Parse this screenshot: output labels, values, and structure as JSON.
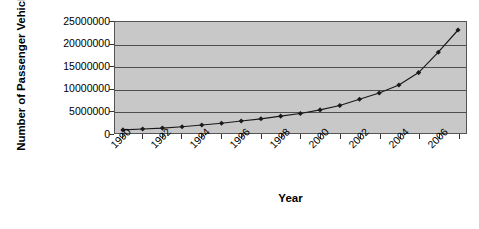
{
  "chart_data": {
    "type": "line",
    "title": "",
    "xlabel": "Year",
    "ylabel": "Number of Passenger Vehicles",
    "x": [
      1990,
      1991,
      1992,
      1993,
      1994,
      1995,
      1996,
      1997,
      1998,
      1999,
      2000,
      2001,
      2002,
      2003,
      2004,
      2005,
      2006,
      2007
    ],
    "values": [
      700000,
      900000,
      1100000,
      1400000,
      1800000,
      2200000,
      2700000,
      3200000,
      3800000,
      4400000,
      5200000,
      6200000,
      7600000,
      9000000,
      10800000,
      13600000,
      18200000,
      23200000
    ],
    "series": [
      {
        "name": "Number of Passenger Vehicles",
        "values": [
          700000,
          900000,
          1100000,
          1400000,
          1800000,
          2200000,
          2700000,
          3200000,
          3800000,
          4400000,
          5200000,
          6200000,
          7600000,
          9000000,
          10800000,
          13600000,
          18200000,
          23200000
        ]
      }
    ],
    "ylim": [
      0,
      25000000
    ],
    "ytick_labels": [
      "25000000",
      "20000000",
      "15000000",
      "10000000",
      "5000000",
      "0"
    ],
    "ytick_values": [
      25000000,
      20000000,
      15000000,
      10000000,
      5000000,
      0
    ],
    "xtick_labels": [
      "1990",
      "1992",
      "1994",
      "1996",
      "1998",
      "2000",
      "2002",
      "2004",
      "2006"
    ],
    "xtick_values": [
      1990,
      1992,
      1994,
      1996,
      1998,
      2000,
      2002,
      2004,
      2006
    ],
    "grid": true,
    "legend": "none",
    "marker": "diamond",
    "plot_background": "#c8c8c8",
    "line_color": "#1a1a1a",
    "gridline_color": "#4d4d4d",
    "axis_color": "#555555"
  },
  "caption": {
    "text": ""
  }
}
